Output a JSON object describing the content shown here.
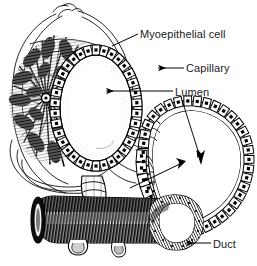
{
  "figure": {
    "kind": "anatomical-line-drawing",
    "background_color": "#ffffff",
    "ink_color": "#000000",
    "text_color": "#1b1b1b",
    "width": 257,
    "height": 266
  },
  "labels": {
    "myoepithelial_cell": "Myoepithelial cell",
    "capillary": "Capillary",
    "lumen": "Lumen",
    "duct": "Duct"
  },
  "structures": {
    "alveolus": "alveolus-cross-section",
    "capillary_network": "capillary-network",
    "epithelial_cell_ring": "cuboidal-epithelial-cell-ring",
    "alveolar_lumen": "alveolar-lumen",
    "duct_branch": "duct-branch",
    "duct_lumen": "duct-lumen",
    "large_duct": "large-duct-cylinder",
    "duct_opening": "duct-opening"
  },
  "leaders": {
    "myoepithelial_cell": "plain-line",
    "capillary": "arrow-left",
    "lumen_alveolus": "arrow-left",
    "lumen_duct": "arrow-down-right",
    "duct": "arrow-left"
  }
}
